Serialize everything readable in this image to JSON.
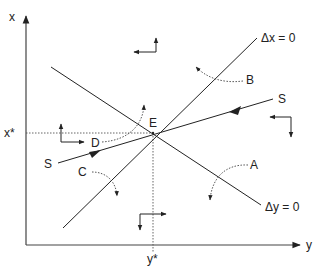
{
  "diagram": {
    "type": "phase-diagram",
    "axes": {
      "vertical_label": "x",
      "horizontal_label": "y",
      "equilibrium_x_label": "x*",
      "equilibrium_y_label": "y*"
    },
    "curves": {
      "dx_zero_label": "Δx = 0",
      "dy_zero_label": "Δy = 0",
      "saddle_path_label_left": "S",
      "saddle_path_label_right": "S"
    },
    "equilibrium_label": "E",
    "trajectory_labels": {
      "A": "A",
      "B": "B",
      "C": "C",
      "D": "D"
    },
    "colors": {
      "line": "#222222",
      "background": "#ffffff"
    }
  }
}
